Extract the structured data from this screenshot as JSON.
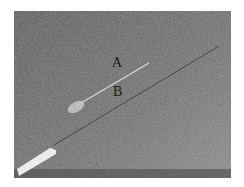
{
  "figure": {
    "labels": {
      "a": "A",
      "b": "B"
    },
    "colors": {
      "border": "#ffffff",
      "background": "#6e6e6e",
      "needle": "#d8d8d8",
      "hub": "#eeeeee",
      "label": "#1a1a1a"
    }
  }
}
